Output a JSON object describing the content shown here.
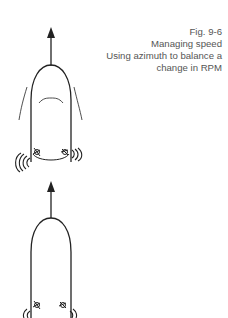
{
  "caption": {
    "figure": "Fig. 9-6",
    "title": "Managing speed",
    "line1": "Using azimuth to balance a",
    "line2": "change in RPM"
  },
  "diagrams": [
    {
      "name": "vessel-top",
      "heading": "ahead",
      "wash": [
        "left-strong",
        "right-medium"
      ],
      "wake_lines": true
    },
    {
      "name": "vessel-bottom",
      "heading": "ahead",
      "wash": [
        "left-small",
        "right-small"
      ],
      "wake_lines": false
    }
  ],
  "colors": {
    "line": "#222222",
    "text": "#555555",
    "background": "#ffffff"
  }
}
